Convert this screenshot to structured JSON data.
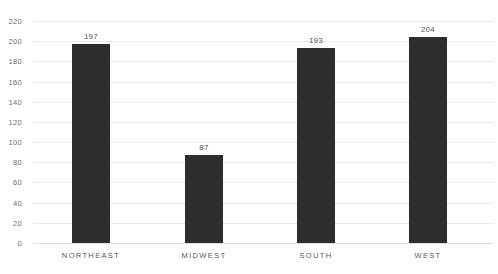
{
  "chart_data": {
    "type": "bar",
    "title": "",
    "xlabel": "",
    "ylabel": "",
    "categories": [
      "NORTHEAST",
      "MIDWEST",
      "SOUTH",
      "WEST"
    ],
    "values": [
      197,
      87,
      193,
      204
    ],
    "ylim": [
      0,
      220
    ],
    "ytick_step": 20,
    "yticks": [
      "220",
      "200",
      "180",
      "160",
      "140",
      "120",
      "100",
      "80",
      "60",
      "40",
      "20",
      "0"
    ],
    "ytick_values": [
      220,
      200,
      180,
      160,
      140,
      120,
      100,
      80,
      60,
      40,
      20,
      0
    ],
    "data_labels": [
      "197",
      "87",
      "193",
      "204"
    ],
    "grid": "horizontal",
    "legend": "none",
    "bar_color": "#2e2e2e",
    "gridline_color": "#e9e9ea",
    "label_color": "#56565a",
    "axis_text_color": "#6e6e72"
  }
}
